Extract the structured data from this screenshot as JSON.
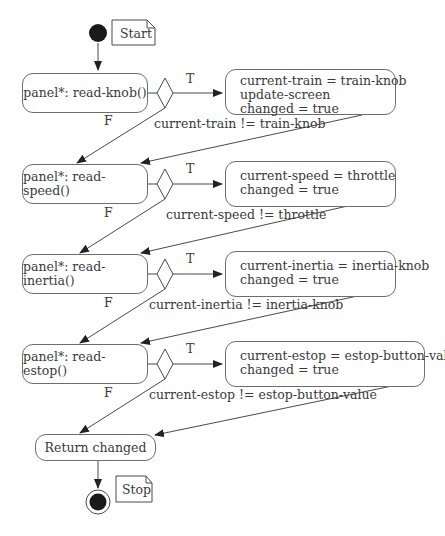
{
  "diagram": {
    "type": "UML activity diagram",
    "start_note": "Start",
    "stop_note": "Stop",
    "true_label": "T",
    "false_label": "F",
    "steps": [
      {
        "action": "panel*: read-knob()",
        "condition": "current-train != train-knob",
        "result_lines": [
          "current-train = train-knob",
          "update-screen",
          "changed = true"
        ]
      },
      {
        "action": "panel*: read-speed()",
        "condition": "current-speed != throttle",
        "result_lines": [
          "current-speed = throttle",
          "changed = true"
        ]
      },
      {
        "action": "panel*: read-inertia()",
        "condition": "current-inertia != inertia-knob",
        "result_lines": [
          "current-inertia = inertia-knob",
          "changed = true"
        ]
      },
      {
        "action": "panel*: read-estop()",
        "condition": "current-estop != estop-button-value",
        "result_lines": [
          "current-estop = estop-button-value",
          "changed = true"
        ]
      }
    ],
    "final_action": "Return changed"
  },
  "colors": {
    "line": "#4a4a4a",
    "node_fill": "#1a1a1a",
    "border": "#6e6e6e"
  }
}
